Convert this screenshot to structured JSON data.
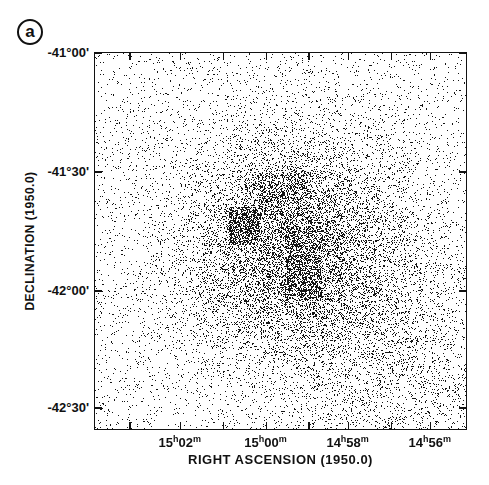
{
  "panel": {
    "label": "a"
  },
  "chart_data": {
    "type": "scatter",
    "title": "",
    "xlabel": "RIGHT ASCENSION (1950.0)",
    "ylabel": "DECLINATION (1950.0)",
    "x_ticks": [
      {
        "h": "15",
        "m": "02",
        "pos": 0.23
      },
      {
        "h": "15",
        "m": "00",
        "pos": 0.46
      },
      {
        "h": "14",
        "m": "58",
        "pos": 0.68
      },
      {
        "h": "14",
        "m": "56",
        "pos": 0.9
      }
    ],
    "x_minor_tick_pos": [
      0.095,
      0.23,
      0.345,
      0.46,
      0.575,
      0.68,
      0.795,
      0.9
    ],
    "y_ticks": [
      {
        "label": "-41°00'",
        "pos": 0.0
      },
      {
        "label": "-41°30'",
        "pos": 0.315
      },
      {
        "label": "-42°00'",
        "pos": 0.63
      },
      {
        "label": "-42°30'",
        "pos": 0.94
      }
    ],
    "x_direction": "decreasing RA to the right",
    "ylim": [
      "-41°00'",
      "-42°35'"
    ],
    "grid": false,
    "features": [
      {
        "name": "diffuse-cloud",
        "cx": 0.53,
        "cy": 0.52,
        "rx": 0.3,
        "ry": 0.3,
        "density": 0.55
      },
      {
        "name": "dense-square-west",
        "x0": 0.36,
        "y0": 0.41,
        "x1": 0.44,
        "y1": 0.51,
        "density": 0.95
      },
      {
        "name": "dense-block-east",
        "x0": 0.51,
        "y0": 0.46,
        "x1": 0.61,
        "y1": 0.65,
        "density": 0.8
      },
      {
        "name": "dense-block-north",
        "x0": 0.44,
        "y0": 0.32,
        "x1": 0.58,
        "y1": 0.44,
        "density": 0.65
      }
    ],
    "background_density": 0.06
  }
}
